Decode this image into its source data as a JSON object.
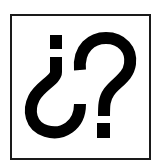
{
  "icon": {
    "glyph_text": "¿?",
    "semantic": "question-marks-icon",
    "colors": {
      "background": "#ffffff",
      "border": "#1a1a1a",
      "glyph": "#000000"
    }
  }
}
